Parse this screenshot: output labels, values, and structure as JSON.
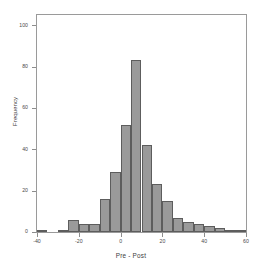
{
  "chart_data": {
    "type": "bar",
    "title": "",
    "xlabel": "Pre - Post",
    "ylabel": "Frequency",
    "xlim": [
      -40,
      60
    ],
    "ylim": [
      0,
      105
    ],
    "bin_width": 5,
    "grid": false,
    "legend": null,
    "bar_color": "#9a9a9a",
    "bar_edge_color": "#5d5d5d",
    "axis_color": "#9a9a9a",
    "xticks": [
      -40,
      -20,
      0,
      20,
      40,
      60
    ],
    "xtick_labels": [
      "-40",
      "-20",
      "0",
      "20",
      "40",
      "60"
    ],
    "yticks": [
      0,
      20,
      40,
      60,
      80,
      100
    ],
    "ytick_labels": [
      "0",
      "20",
      "40",
      "60",
      "80",
      "100"
    ],
    "bin_starts": [
      -40,
      -35,
      -30,
      -25,
      -20,
      -15,
      -10,
      -5,
      0,
      5,
      10,
      15,
      20,
      25,
      30,
      35,
      40,
      45,
      50,
      55
    ],
    "categories": [
      "-40",
      "-35",
      "-30",
      "-25",
      "-20",
      "-15",
      "-10",
      "-5",
      "0",
      "5",
      "10",
      "15",
      "20",
      "25",
      "30",
      "35",
      "40",
      "45",
      "50",
      "55"
    ],
    "values": [
      1,
      0,
      1,
      6,
      4,
      4,
      16,
      29,
      52,
      83,
      42,
      23,
      15,
      7,
      5,
      4,
      3,
      2,
      1,
      1
    ]
  }
}
